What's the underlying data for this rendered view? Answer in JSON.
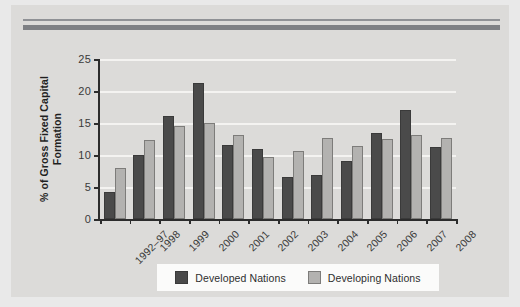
{
  "figure": {
    "background_color": "#dcdbd9",
    "rule_color": "#8f9195"
  },
  "chart_data": {
    "type": "bar",
    "title": "",
    "xlabel": "",
    "ylabel": "% of Gross Fixed Capital Formation",
    "ylabel_line1": "% of Gross Fixed Capital",
    "ylabel_line2": "Formation",
    "ylim": [
      0,
      25
    ],
    "yticks": [
      0,
      5,
      10,
      15,
      20,
      25
    ],
    "ytick_labels": [
      "0",
      "5",
      "10",
      "15",
      "20",
      "25"
    ],
    "grid": "horizontal",
    "legend_position": "bottom",
    "categories": [
      "1992–97",
      "1998",
      "1999",
      "2000",
      "2001",
      "2002",
      "2003",
      "2004",
      "2005",
      "2006",
      "2007",
      "2008"
    ],
    "series": [
      {
        "name": "Developed Nations",
        "color": "#4a4a4a",
        "values": [
          4.2,
          10.0,
          16.1,
          21.2,
          11.5,
          11.0,
          6.5,
          6.8,
          9.0,
          13.4,
          17.1,
          11.3
        ]
      },
      {
        "name": "Developing Nations",
        "color": "#b3b2b0",
        "values": [
          7.9,
          12.3,
          14.6,
          15.0,
          13.1,
          9.7,
          10.7,
          12.6,
          11.4,
          12.5,
          13.2,
          12.7
        ]
      }
    ]
  },
  "legend": {
    "items": [
      {
        "label": "Developed Nations",
        "color": "#4a4a4a"
      },
      {
        "label": "Developing Nations",
        "color": "#b3b2b0"
      }
    ]
  }
}
